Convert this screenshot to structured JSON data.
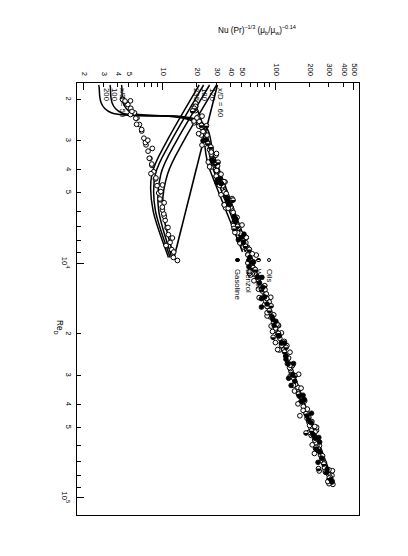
{
  "figure": {
    "orientation_note": "printed sideways",
    "xaxis": {
      "title_main": "Re",
      "title_sub": "D",
      "scale": "log",
      "range": [
        1700,
        120000
      ],
      "major_labels": [
        "10³",
        "10⁴",
        "10⁵"
      ],
      "minor_labels": [
        "2",
        "3",
        "4",
        "5",
        "2",
        "3",
        "4",
        "5",
        "2",
        "3",
        "4",
        "5"
      ]
    },
    "yaxis": {
      "title": "Nu (Pr)⁻¹ᶠ³ (μ_b/μ_w)⁻⁰·¹⁴",
      "title_parts": {
        "nu": "Nu",
        "pr": "(Pr)",
        "pr_exp": "–1/3",
        "visc": "(μ",
        "visc_sub_b": "b",
        "visc_mid": "/μ",
        "visc_sub_w": "w",
        "visc_close": ")",
        "visc_exp": "–0.14"
      },
      "scale": "log",
      "range": [
        1.7,
        560
      ],
      "labels": [
        "2",
        "3",
        "4",
        "5",
        "10",
        "20",
        "30",
        "40",
        "50",
        "100",
        "200",
        "300",
        "400",
        "500"
      ]
    },
    "legend": {
      "items": [
        {
          "marker": "open-circle",
          "label": "Oils"
        },
        {
          "marker": "half-circle",
          "label": "Water"
        },
        {
          "marker": "filled-circle",
          "label": "Benzol"
        },
        {
          "marker": "filled-circle",
          "label": "Gasoline"
        }
      ]
    },
    "curve_labels": {
      "upper_family_prefix": "x/D = 60",
      "upper_family_rest": [
        "120",
        "180",
        "235"
      ],
      "lower_family_prefix": "x/D = 50",
      "lower_family_rest": [
        "100",
        "200"
      ]
    }
  },
  "chart_data": {
    "type": "scatter",
    "title": "",
    "subtitle": "",
    "xlabel": "Re_D",
    "ylabel": "Nu (Pr)^-1/3 (mu_b/mu_w)^-0.14",
    "xscale": "log",
    "yscale": "log",
    "xlim": [
      1700,
      120000
    ],
    "ylim": [
      1.7,
      560
    ],
    "grid": false,
    "legend_position": "center-right",
    "xticks_major": [
      1000,
      10000,
      100000
    ],
    "xticks_major_labels": [
      "10^3",
      "10^4",
      "10^5"
    ],
    "xticks_minor": [
      2000,
      3000,
      4000,
      5000,
      20000,
      30000,
      40000,
      50000
    ],
    "xticks_minor_labels": [
      "2",
      "3",
      "4",
      "5",
      "2",
      "3",
      "4",
      "5"
    ],
    "yticks": [
      2,
      3,
      4,
      5,
      10,
      20,
      30,
      40,
      50,
      100,
      200,
      300,
      400,
      500
    ],
    "yticks_labels": [
      "2",
      "3",
      "4",
      "5",
      "10",
      "20",
      "30",
      "40",
      "50",
      "100",
      "200",
      "300",
      "400",
      "500"
    ],
    "series": [
      {
        "name": "Oils",
        "marker": "open-circle",
        "note": "turbulent-regime scatter band, upper-right cloud",
        "points": [
          [
            88000,
            322
          ],
          [
            84000,
            300
          ],
          [
            80000,
            296
          ],
          [
            78000,
            280
          ],
          [
            74000,
            272
          ],
          [
            70000,
            258
          ],
          [
            66000,
            250
          ],
          [
            63000,
            240
          ],
          [
            60000,
            232
          ],
          [
            57000,
            222
          ],
          [
            54000,
            214
          ],
          [
            51000,
            206
          ],
          [
            48000,
            198
          ],
          [
            46000,
            190
          ],
          [
            43000,
            182
          ],
          [
            41000,
            176
          ],
          [
            39000,
            168
          ],
          [
            37000,
            162
          ],
          [
            35000,
            156
          ],
          [
            33000,
            150
          ],
          [
            31000,
            144
          ],
          [
            29500,
            138
          ],
          [
            28000,
            133
          ],
          [
            26500,
            128
          ],
          [
            25000,
            123
          ],
          [
            23500,
            118
          ],
          [
            22500,
            113
          ],
          [
            21000,
            109
          ],
          [
            20000,
            104
          ],
          [
            19000,
            100
          ],
          [
            18000,
            96
          ],
          [
            17000,
            92
          ],
          [
            16200,
            89
          ],
          [
            15400,
            85
          ],
          [
            14600,
            82
          ],
          [
            13900,
            79
          ],
          [
            13200,
            76
          ],
          [
            12500,
            73
          ],
          [
            11900,
            70
          ],
          [
            11300,
            67
          ],
          [
            10700,
            65
          ],
          [
            10200,
            62
          ],
          [
            9700,
            60
          ],
          [
            9200,
            57
          ],
          [
            8700,
            55
          ],
          [
            8300,
            53
          ],
          [
            7900,
            51
          ],
          [
            7500,
            49
          ],
          [
            7100,
            47
          ],
          [
            6800,
            45
          ],
          [
            6400,
            43
          ],
          [
            6100,
            42
          ],
          [
            5800,
            40
          ],
          [
            5500,
            38
          ],
          [
            5200,
            37
          ],
          [
            5000,
            35
          ],
          [
            4700,
            34
          ],
          [
            4500,
            33
          ],
          [
            4300,
            31
          ],
          [
            4050,
            30
          ],
          [
            3850,
            29
          ],
          [
            3650,
            28
          ],
          [
            3450,
            27
          ],
          [
            3300,
            26
          ],
          [
            3100,
            25
          ],
          [
            2950,
            24
          ],
          [
            2800,
            23
          ],
          [
            2650,
            22
          ],
          [
            2500,
            21
          ],
          [
            2400,
            20.5
          ],
          [
            2250,
            19.5
          ],
          [
            2150,
            19
          ]
        ]
      },
      {
        "name": "Water",
        "marker": "half-circle",
        "note": "interspersed within the same band",
        "points": [
          [
            82000,
            305
          ],
          [
            72000,
            268
          ],
          [
            62000,
            238
          ],
          [
            52000,
            208
          ],
          [
            44000,
            186
          ],
          [
            36000,
            160
          ],
          [
            30000,
            140
          ],
          [
            24000,
            120
          ],
          [
            20000,
            106
          ],
          [
            16000,
            88
          ],
          [
            13000,
            75
          ],
          [
            10500,
            63
          ],
          [
            8500,
            54
          ],
          [
            7000,
            46
          ],
          [
            5600,
            39
          ],
          [
            4600,
            33
          ],
          [
            3800,
            29
          ],
          [
            3100,
            25
          ],
          [
            2600,
            22
          ],
          [
            2200,
            19
          ]
        ]
      },
      {
        "name": "Benzol",
        "marker": "filled-circle",
        "points": [
          [
            76000,
            286
          ],
          [
            64000,
            246
          ],
          [
            54000,
            216
          ],
          [
            45000,
            190
          ],
          [
            37000,
            164
          ],
          [
            30000,
            142
          ],
          [
            25000,
            124
          ],
          [
            20500,
            108
          ],
          [
            17000,
            93
          ],
          [
            14000,
            80
          ],
          [
            11500,
            69
          ],
          [
            9500,
            59
          ],
          [
            7800,
            50
          ],
          [
            6400,
            43
          ],
          [
            5300,
            37
          ],
          [
            4400,
            32
          ]
        ]
      },
      {
        "name": "Gasoline",
        "marker": "filled-circle",
        "points": [
          [
            86000,
            316
          ],
          [
            68000,
            256
          ],
          [
            56000,
            224
          ],
          [
            47000,
            196
          ],
          [
            39000,
            170
          ],
          [
            32000,
            148
          ],
          [
            27000,
            129
          ],
          [
            22000,
            112
          ],
          [
            18500,
            97
          ],
          [
            15000,
            84
          ],
          [
            12200,
            72
          ],
          [
            10000,
            61
          ],
          [
            8200,
            52
          ],
          [
            6700,
            44
          ],
          [
            5500,
            38
          ],
          [
            4600,
            33
          ],
          [
            3700,
            28
          ],
          [
            3000,
            24
          ]
        ]
      },
      {
        "name": "Laminar/transition data (lower-left cloud)",
        "marker": "open-circle",
        "points": [
          [
            9500,
            12.4
          ],
          [
            8800,
            12.0
          ],
          [
            8200,
            11.6
          ],
          [
            7600,
            11.2
          ],
          [
            7100,
            10.9
          ],
          [
            6600,
            10.5
          ],
          [
            6200,
            10.2
          ],
          [
            5800,
            9.9
          ],
          [
            5400,
            9.5
          ],
          [
            5050,
            9.2
          ],
          [
            4700,
            8.9
          ],
          [
            4400,
            8.6
          ],
          [
            4100,
            8.3
          ],
          [
            3850,
            8.0
          ],
          [
            3600,
            7.7
          ],
          [
            3350,
            7.4
          ],
          [
            3150,
            7.1
          ],
          [
            2950,
            6.8
          ],
          [
            2750,
            6.5
          ],
          [
            2580,
            6.2
          ],
          [
            2420,
            5.9
          ],
          [
            2300,
            5.6
          ],
          [
            2200,
            5.2
          ],
          [
            2120,
            4.9
          ],
          [
            2060,
            4.6
          ],
          [
            2020,
            4.4
          ]
        ]
      }
    ],
    "fit_lines": [
      {
        "name": "turbulent correlation line",
        "points": [
          [
            2050,
            19.0
          ],
          [
            88000,
            330
          ]
        ]
      },
      {
        "name": "lower-branch correlation line",
        "points": [
          [
            1750,
            30.5
          ],
          [
            9500,
            12.6
          ]
        ]
      }
    ],
    "families": [
      {
        "name": "upper x/D family",
        "labels": [
          "x/D = 60",
          "120",
          "180",
          "235"
        ],
        "curves": [
          {
            "label": "60",
            "points": [
              [
                1750,
                30.0
              ],
              [
                3000,
                15.5
              ],
              [
                4200,
                11.0
              ],
              [
                6000,
                10.0
              ],
              [
                9500,
                12.6
              ]
            ]
          },
          {
            "label": "120",
            "points": [
              [
                1750,
                26.0
              ],
              [
                3000,
                13.4
              ],
              [
                4200,
                9.6
              ],
              [
                6000,
                9.2
              ],
              [
                9500,
                12.0
              ]
            ]
          },
          {
            "label": "180",
            "points": [
              [
                1750,
                23.0
              ],
              [
                3000,
                12.0
              ],
              [
                4200,
                8.6
              ],
              [
                6000,
                8.6
              ],
              [
                9500,
                11.6
              ]
            ]
          },
          {
            "label": "235",
            "points": [
              [
                1750,
                21.0
              ],
              [
                3000,
                11.0
              ],
              [
                4200,
                8.0
              ],
              [
                6000,
                8.2
              ],
              [
                9500,
                11.2
              ]
            ]
          }
        ]
      },
      {
        "name": "lower x/D family",
        "labels": [
          "x/D = 50",
          "100",
          "200"
        ],
        "curves": [
          {
            "label": "50",
            "points": [
              [
                1750,
                4.3
              ],
              [
                2300,
                5.3
              ],
              [
                2500,
                21.5
              ],
              [
                4000,
                30
              ],
              [
                9000,
                57
              ]
            ]
          },
          {
            "label": "100",
            "points": [
              [
                1750,
                3.4
              ],
              [
                2300,
                4.3
              ],
              [
                2500,
                20.0
              ],
              [
                4000,
                28
              ],
              [
                9000,
                54
              ]
            ]
          },
          {
            "label": "200",
            "points": [
              [
                1750,
                2.7
              ],
              [
                2300,
                3.5
              ],
              [
                2500,
                18.5
              ],
              [
                4000,
                26
              ],
              [
                9000,
                51
              ]
            ]
          }
        ]
      }
    ]
  }
}
